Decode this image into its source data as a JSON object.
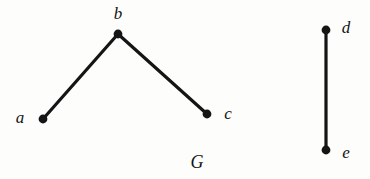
{
  "figure": {
    "width": 370,
    "height": 179,
    "background_color": "#fdfdfc",
    "ink_color": "#151515",
    "caption": "G"
  },
  "graph": {
    "name": "G",
    "name_label_position": {
      "x": 197,
      "y": 162
    },
    "edge_width": 3.2,
    "vertex_radius": 4.4,
    "vertices": [
      {
        "id": "a",
        "label": "a",
        "x": 43,
        "y": 119,
        "label_x": 20,
        "label_y": 117
      },
      {
        "id": "b",
        "label": "b",
        "x": 118,
        "y": 34,
        "label_x": 118,
        "label_y": 13
      },
      {
        "id": "c",
        "label": "c",
        "x": 207,
        "y": 114,
        "label_x": 228,
        "label_y": 113
      },
      {
        "id": "d",
        "label": "d",
        "x": 326,
        "y": 30,
        "label_x": 346,
        "label_y": 27
      },
      {
        "id": "e",
        "label": "e",
        "x": 326,
        "y": 150,
        "label_x": 346,
        "label_y": 152
      }
    ],
    "edges": [
      {
        "id": "ab",
        "from": "a",
        "to": "b"
      },
      {
        "id": "bc",
        "from": "b",
        "to": "c"
      },
      {
        "id": "de",
        "from": "d",
        "to": "e"
      }
    ]
  }
}
